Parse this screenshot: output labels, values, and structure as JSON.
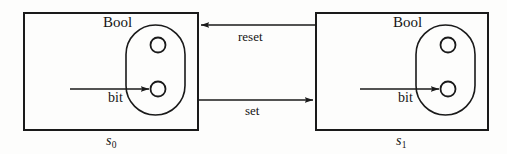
{
  "figure": {
    "kind": "state-transition-diagram",
    "background_color": "#fdfdfc",
    "stroke_color": "#1a1a1a"
  },
  "states": [
    {
      "id": "s0",
      "label": "s",
      "subscript": "0",
      "box": {
        "x": 24,
        "y": 13,
        "width": 174,
        "height": 117
      },
      "type_label": "Bool",
      "type_label_pos": {
        "x": 103,
        "y": 15
      },
      "stadium": {
        "x": 126,
        "y": 25,
        "width": 59,
        "height": 90,
        "radius": 29.5
      },
      "circles": [
        {
          "name": "upper-circle",
          "cx": 158,
          "cy": 45,
          "r": 7.5,
          "filled": false
        },
        {
          "name": "lower-circle",
          "cx": 158,
          "cy": 89,
          "r": 7.5,
          "filled": false
        }
      ],
      "input": {
        "label": "bit",
        "label_pos": {
          "x": 108,
          "y": 91
        },
        "arrow": {
          "x1": 70,
          "y1": 89,
          "x2": 150,
          "y2": 89
        }
      }
    },
    {
      "id": "s1",
      "label": "s",
      "subscript": "1",
      "box": {
        "x": 316,
        "y": 13,
        "width": 172,
        "height": 117
      },
      "type_label": "Bool",
      "type_label_pos": {
        "x": 393,
        "y": 15
      },
      "stadium": {
        "x": 416,
        "y": 25,
        "width": 59,
        "height": 90,
        "radius": 29.5
      },
      "circles": [
        {
          "name": "upper-circle",
          "cx": 448,
          "cy": 45,
          "r": 7.5,
          "filled": false
        },
        {
          "name": "lower-circle",
          "cx": 448,
          "cy": 89,
          "r": 7.5,
          "filled": false
        }
      ],
      "input": {
        "label": "bit",
        "label_pos": {
          "x": 398,
          "y": 91
        },
        "arrow": {
          "x1": 360,
          "y1": 89,
          "x2": 440,
          "y2": 89
        }
      }
    }
  ],
  "transitions": [
    {
      "id": "reset",
      "label": "reset",
      "label_pos": {
        "x": 238,
        "y": 30
      },
      "direction": "right-to-left",
      "from": "s1",
      "to": "s0",
      "arrow": {
        "x1": 316,
        "y1": 25,
        "x2": 200,
        "y2": 25
      }
    },
    {
      "id": "set",
      "label": "set",
      "label_pos": {
        "x": 245,
        "y": 104
      },
      "direction": "left-to-right",
      "from": "s0",
      "to": "s1",
      "arrow": {
        "x1": 198,
        "y1": 100,
        "x2": 314,
        "y2": 100
      }
    }
  ]
}
